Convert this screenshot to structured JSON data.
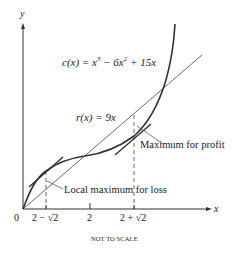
{
  "diagram": {
    "axes": {
      "y_label": "y",
      "x_label": "x",
      "origin_label": "0"
    },
    "x_ticks": [
      {
        "label": "2 − √2"
      },
      {
        "label": "2"
      },
      {
        "label": "2 + √2"
      }
    ],
    "cost_curve": {
      "label_prefix": "c(x) = x",
      "exp1": "3",
      "middle": " − 6x",
      "exp2": "2",
      "suffix": " + 15x"
    },
    "revenue_line": {
      "label": "r(x) = 9x"
    },
    "annotations": {
      "max_profit": "Maximum for profit",
      "local_max_loss": "Local maximum for loss"
    },
    "footnote": "NOT TO SCALE",
    "colors": {
      "curve": "#333333",
      "line": "#444444",
      "text": "#222222"
    }
  }
}
